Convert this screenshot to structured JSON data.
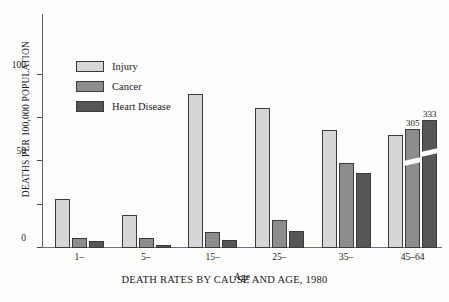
{
  "chart_data": {
    "type": "bar",
    "title": "DEATH RATES BY CAUSE AND AGE, 1980",
    "xlabel": "Age",
    "ylabel": "DEATHS PER 100,000 POPULATION",
    "categories": [
      "1–",
      "5–",
      "15–",
      "25–",
      "35–",
      "45–64"
    ],
    "series": [
      {
        "name": "Injury",
        "color": "#d6d6d4",
        "values": [
          28,
          19,
          89,
          81,
          68,
          65
        ]
      },
      {
        "name": "Cancer",
        "color": "#8d8d8b",
        "values": [
          6,
          6,
          9,
          16,
          49,
          305
        ]
      },
      {
        "name": "Heart Disease",
        "color": "#565654",
        "values": [
          4,
          1.5,
          4.5,
          10,
          43,
          333
        ]
      }
    ],
    "ylim": [
      0,
      135
    ],
    "yticks": [
      0,
      25,
      50,
      75,
      100
    ],
    "ytick_labels": [
      "0",
      "",
      "50",
      "",
      "100"
    ],
    "grid": false,
    "legend_position": "upper-left",
    "broken_axis": true,
    "broken_bars": [
      {
        "group": "45–64",
        "series": "Cancer",
        "label": "305",
        "drawn_height": 119
      },
      {
        "group": "45–64",
        "series": "Heart Disease",
        "label": "333",
        "drawn_height": 128
      }
    ],
    "annotations": [
      "305",
      "333"
    ]
  },
  "legend": {
    "items": [
      {
        "label": "Injury"
      },
      {
        "label": "Cancer"
      },
      {
        "label": "Heart Disease"
      }
    ]
  }
}
